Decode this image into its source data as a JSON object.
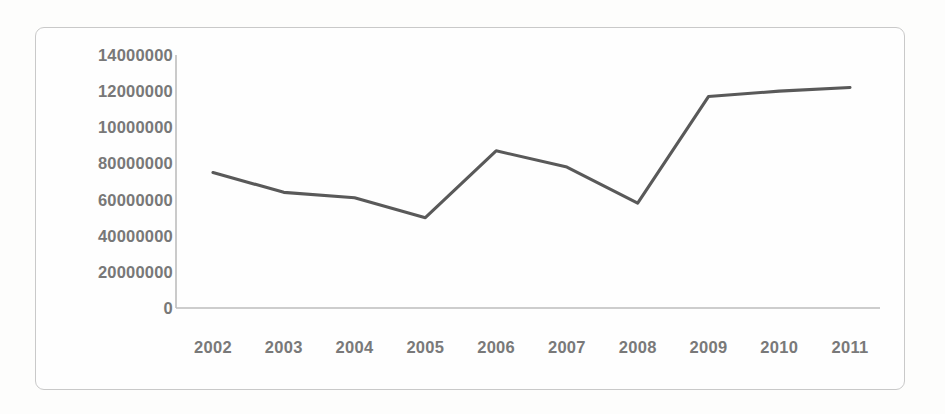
{
  "chart_data": {
    "type": "line",
    "title": "",
    "subtitle": "",
    "xlabel": "",
    "ylabel": "",
    "categories": [
      "2002",
      "2003",
      "2004",
      "2005",
      "2006",
      "2007",
      "2008",
      "2009",
      "2010",
      "2011"
    ],
    "values": [
      7500000,
      6400000,
      6100000,
      5000000,
      8700000,
      7800000,
      5800000,
      11700000,
      12000000,
      12200000
    ],
    "series": [
      {
        "name": "",
        "values": [
          7500000,
          6400000,
          6100000,
          5000000,
          8700000,
          7800000,
          5800000,
          11700000,
          12000000,
          12200000
        ]
      }
    ],
    "ylim": [
      0,
      14000000
    ],
    "y_tick_values": [
      14000000,
      12000000,
      10000000,
      8000000,
      6000000,
      4000000,
      2000000,
      0
    ],
    "y_tick_labels": [
      "14000000",
      "12000000",
      "10000000",
      "80000000",
      "60000000",
      "40000000",
      "20000000",
      "0"
    ],
    "grid": false,
    "legend": false,
    "legend_position": "none",
    "line_color": "#595959",
    "axis_color": "#b8b8b8",
    "tick_label_color": "#666666"
  },
  "figure": {
    "frame_color": "#c9c9c9",
    "background_color": "#fdfdfc"
  }
}
